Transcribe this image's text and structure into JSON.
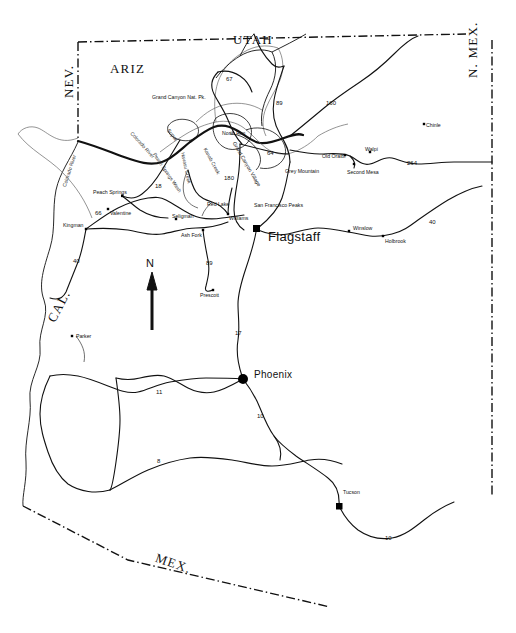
{
  "map": {
    "title": "Map of Arizona",
    "background_color": "#ffffff",
    "line_color": "#000000",
    "border_style": "dash-dot",
    "compass": {
      "label": "N"
    },
    "state_labels": [
      {
        "id": "utah",
        "text": "UTAH",
        "x": 233,
        "y": 33,
        "rotate": 0
      },
      {
        "id": "ariz",
        "text": "ARIZ",
        "x": 110,
        "y": 62,
        "rotate": 0
      },
      {
        "id": "nev",
        "text": "NEV.",
        "x": 62,
        "y": 98,
        "rotate": -90
      },
      {
        "id": "cal",
        "text": "CAL.",
        "x": 45,
        "y": 318,
        "rotate": -62
      },
      {
        "id": "nmex",
        "text": "N. MEX.",
        "x": 466,
        "y": 78,
        "rotate": -90
      },
      {
        "id": "mex",
        "text": "MEX.",
        "x": 158,
        "y": 551,
        "rotate": 19
      }
    ],
    "features": [
      {
        "id": "grand-canyon-np",
        "text": "Grand Canyon Nat. Pk.",
        "x": 152,
        "y": 95,
        "rotate": 0
      },
      {
        "id": "north-rim",
        "text": "North Rim",
        "x": 222,
        "y": 131,
        "rotate": 0
      },
      {
        "id": "san-francisco-peaks",
        "text": "San Francisco Peaks",
        "x": 254,
        "y": 203,
        "rotate": 0
      },
      {
        "id": "grey-mountain",
        "text": "Grey Mountain",
        "x": 285,
        "y": 169,
        "rotate": 0
      },
      {
        "id": "grand-canyon-village",
        "text": "Grand Canyon Village",
        "x": 236,
        "y": 141,
        "rotate": 60
      }
    ],
    "rivers": [
      {
        "id": "colorado-river-north",
        "text": "Colorado River",
        "x": 133,
        "y": 131,
        "rotate": 48
      },
      {
        "id": "colorado-river-west",
        "text": "Colorado River",
        "x": 62,
        "y": 186,
        "rotate": -72
      },
      {
        "id": "kanab-creek",
        "text": "Kanab Creek",
        "x": 207,
        "y": 147,
        "rotate": 62
      },
      {
        "id": "havasu-creek",
        "text": "Havasu Creek",
        "x": 185,
        "y": 152,
        "rotate": 78
      },
      {
        "id": "peach-springs-wash",
        "text": "Peach Springs Wash",
        "x": 156,
        "y": 152,
        "rotate": 56
      }
    ],
    "cities": [
      {
        "id": "supai",
        "text": "Supai",
        "x": 170,
        "y": 128,
        "rotate": 52,
        "marker": false,
        "size": "small"
      },
      {
        "id": "peach-springs",
        "text": "Peach Springs",
        "x": 93,
        "y": 190,
        "marker": true,
        "mx": 122,
        "my": 196,
        "size": "small"
      },
      {
        "id": "valentine",
        "text": "Valentine",
        "x": 110,
        "y": 211,
        "marker": true,
        "mx": 108,
        "my": 209,
        "size": "small"
      },
      {
        "id": "kingman",
        "text": "Kingman",
        "x": 63,
        "y": 223,
        "marker": true,
        "mx": 86,
        "my": 229,
        "size": "small"
      },
      {
        "id": "seligman",
        "text": "Seligman",
        "x": 172,
        "y": 214,
        "marker": true,
        "mx": 176,
        "my": 219,
        "size": "small"
      },
      {
        "id": "ash-fork",
        "text": "Ash Fork",
        "x": 181,
        "y": 233,
        "marker": true,
        "mx": 203,
        "my": 230,
        "size": "small"
      },
      {
        "id": "red-lake",
        "text": "Red Lake",
        "x": 207,
        "y": 202,
        "marker": false,
        "size": "small"
      },
      {
        "id": "williams",
        "text": "Williams",
        "x": 229,
        "y": 216,
        "marker": true,
        "mx": 228,
        "my": 214,
        "size": "small"
      },
      {
        "id": "flagstaff",
        "text": "Flagstaff",
        "x": 268,
        "y": 230,
        "marker": true,
        "mx": 256,
        "my": 228,
        "size": "big"
      },
      {
        "id": "winslow",
        "text": "Winslow",
        "x": 353,
        "y": 226,
        "marker": true,
        "mx": 349,
        "my": 231,
        "size": "small"
      },
      {
        "id": "holbrook",
        "text": "Holbrook",
        "x": 385,
        "y": 239,
        "marker": true,
        "mx": 383,
        "my": 236,
        "size": "small"
      },
      {
        "id": "old-oraibi",
        "text": "Old Oraibi",
        "x": 322,
        "y": 154,
        "marker": true,
        "mx": 345,
        "my": 155,
        "size": "small"
      },
      {
        "id": "walpi",
        "text": "Walpi",
        "x": 365,
        "y": 147,
        "marker": true,
        "mx": 370,
        "my": 152,
        "size": "small"
      },
      {
        "id": "second-mesa",
        "text": "Second Mesa",
        "x": 347,
        "y": 170,
        "marker": true,
        "mx": 354,
        "my": 164,
        "size": "small"
      },
      {
        "id": "chinle",
        "text": "Chinle",
        "x": 426,
        "y": 123,
        "marker": true,
        "mx": 424,
        "my": 124,
        "size": "small"
      },
      {
        "id": "prescott",
        "text": "Prescott",
        "x": 200,
        "y": 293,
        "marker": true,
        "mx": 213,
        "my": 290,
        "size": "small"
      },
      {
        "id": "parker",
        "text": "Parker",
        "x": 76,
        "y": 334,
        "marker": true,
        "mx": 72,
        "my": 336,
        "size": "small"
      },
      {
        "id": "phoenix",
        "text": "Phoenix",
        "x": 254,
        "y": 370,
        "marker": true,
        "mx": 243,
        "my": 379,
        "size": "mid"
      },
      {
        "id": "tucson",
        "text": "Tucson",
        "x": 343,
        "y": 490,
        "marker": true,
        "mx": 339,
        "my": 506,
        "size": "small"
      }
    ],
    "routes": [
      {
        "id": "route-67",
        "number": "67",
        "x": 226,
        "y": 76
      },
      {
        "id": "route-89n",
        "number": "89",
        "x": 276,
        "y": 100
      },
      {
        "id": "route-160",
        "number": "160",
        "x": 326,
        "y": 100
      },
      {
        "id": "route-264",
        "number": "264",
        "x": 407,
        "y": 160
      },
      {
        "id": "route-64",
        "number": "64",
        "x": 267,
        "y": 150
      },
      {
        "id": "route-180",
        "number": "180",
        "x": 224,
        "y": 175
      },
      {
        "id": "route-18",
        "number": "18",
        "x": 155,
        "y": 183
      },
      {
        "id": "route-66",
        "number": "66",
        "x": 95,
        "y": 210
      },
      {
        "id": "route-40w",
        "number": "40",
        "x": 73,
        "y": 258
      },
      {
        "id": "route-40e",
        "number": "40",
        "x": 429,
        "y": 219
      },
      {
        "id": "route-89s",
        "number": "89",
        "x": 206,
        "y": 260
      },
      {
        "id": "route-17",
        "number": "17",
        "x": 235,
        "y": 330
      },
      {
        "id": "route-11",
        "number": "11",
        "x": 156,
        "y": 389
      },
      {
        "id": "route-10s",
        "number": "10",
        "x": 257,
        "y": 413
      },
      {
        "id": "route-8",
        "number": "8",
        "x": 157,
        "y": 458
      },
      {
        "id": "route-10e",
        "number": "10",
        "x": 385,
        "y": 535
      }
    ]
  }
}
